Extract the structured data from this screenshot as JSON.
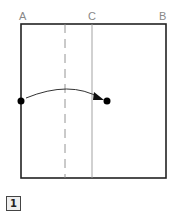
{
  "labels": {
    "a": "A",
    "b": "B",
    "c": "C"
  },
  "step": {
    "number": "1"
  },
  "colors": {
    "outline": "#222222",
    "guide": "#999999",
    "dot": "#000000"
  }
}
